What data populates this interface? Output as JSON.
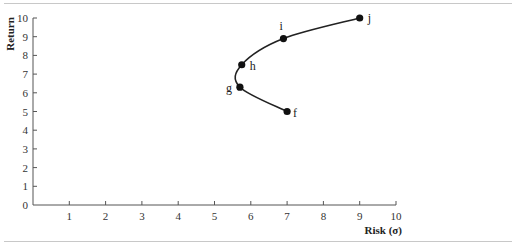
{
  "chart_data": {
    "type": "line",
    "title": "",
    "xlabel": "Risk (σ)",
    "ylabel": "Return",
    "xlim": [
      0,
      10
    ],
    "ylim": [
      0,
      10
    ],
    "grid": false,
    "legend": null,
    "x_ticks": [
      "1",
      "2",
      "3",
      "4",
      "5",
      "6",
      "7",
      "8",
      "9",
      "10"
    ],
    "y_ticks": [
      "0",
      "1",
      "2",
      "3",
      "4",
      "5",
      "6",
      "7",
      "8",
      "9",
      "10"
    ],
    "series": [
      {
        "name": "efficient frontier",
        "points": [
          {
            "label": "f",
            "x": 7.0,
            "y": 5.0
          },
          {
            "label": "g",
            "x": 5.7,
            "y": 6.3
          },
          {
            "label": "h",
            "x": 5.75,
            "y": 7.5
          },
          {
            "label": "i",
            "x": 6.9,
            "y": 8.9
          },
          {
            "label": "j",
            "x": 9.0,
            "y": 10.0
          }
        ]
      }
    ]
  }
}
